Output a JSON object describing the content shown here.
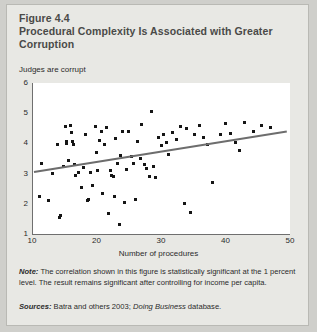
{
  "figure": {
    "number": "Figure 4.4",
    "title": "Procedural Complexity Is Associated with Greater Corruption",
    "note_lead": "Note:",
    "note_text": " The correlation shown in this figure is statistically significant at the 1 percent level. The result remains significant after controlling for income per capita.",
    "sources_lead": "Sources:",
    "sources_text_1": " Batra and others 2003; ",
    "sources_italic": "Doing Business",
    "sources_text_2": " database."
  },
  "colors": {
    "card_background": "#e8e8e4",
    "page_background": "#cfcfcb",
    "plot_background": "#ffffff",
    "axis": "#6f6f6f",
    "point": "#151515",
    "trendline": "#6d6d6d",
    "title_text": "#4a4a48",
    "body_text": "#2b2b2b"
  },
  "chart_data": {
    "type": "scatter",
    "title": "Procedural Complexity Is Associated with Greater Corruption",
    "xlabel": "Number of procedures",
    "ylabel": "Judges are corrupt",
    "xlim": [
      10,
      50
    ],
    "ylim": [
      1,
      6
    ],
    "xticks": [
      10,
      20,
      30,
      40,
      50
    ],
    "yticks": [
      1,
      2,
      3,
      4,
      5,
      6
    ],
    "grid": false,
    "legend": null,
    "trendline": {
      "type": "linear-fit",
      "x_start": 10.3,
      "y_start": 3.08,
      "x_end": 49.5,
      "y_end": 4.42
    },
    "points": [
      {
        "x": 11.2,
        "y": 2.25
      },
      {
        "x": 11.5,
        "y": 3.35
      },
      {
        "x": 12.6,
        "y": 2.1
      },
      {
        "x": 13.2,
        "y": 3.0
      },
      {
        "x": 14.0,
        "y": 3.95
      },
      {
        "x": 14.3,
        "y": 1.55
      },
      {
        "x": 14.4,
        "y": 1.62
      },
      {
        "x": 14.9,
        "y": 3.25
      },
      {
        "x": 15.2,
        "y": 4.55
      },
      {
        "x": 15.3,
        "y": 4.05
      },
      {
        "x": 15.4,
        "y": 4.0
      },
      {
        "x": 15.6,
        "y": 3.42
      },
      {
        "x": 16.0,
        "y": 4.6
      },
      {
        "x": 16.1,
        "y": 4.35
      },
      {
        "x": 16.3,
        "y": 4.05
      },
      {
        "x": 16.4,
        "y": 3.98
      },
      {
        "x": 16.6,
        "y": 3.3
      },
      {
        "x": 16.8,
        "y": 2.95
      },
      {
        "x": 17.2,
        "y": 3.02
      },
      {
        "x": 17.6,
        "y": 2.55
      },
      {
        "x": 18.0,
        "y": 3.2
      },
      {
        "x": 18.3,
        "y": 4.3
      },
      {
        "x": 18.6,
        "y": 2.1
      },
      {
        "x": 18.7,
        "y": 2.15
      },
      {
        "x": 19.0,
        "y": 3.05
      },
      {
        "x": 19.4,
        "y": 2.6
      },
      {
        "x": 19.8,
        "y": 4.55
      },
      {
        "x": 20.0,
        "y": 3.7
      },
      {
        "x": 20.2,
        "y": 3.1
      },
      {
        "x": 20.5,
        "y": 4.1
      },
      {
        "x": 20.8,
        "y": 4.4
      },
      {
        "x": 21.0,
        "y": 2.35
      },
      {
        "x": 21.3,
        "y": 3.95
      },
      {
        "x": 21.6,
        "y": 4.52
      },
      {
        "x": 21.9,
        "y": 1.68
      },
      {
        "x": 22.2,
        "y": 3.1
      },
      {
        "x": 22.4,
        "y": 2.95
      },
      {
        "x": 22.6,
        "y": 2.9
      },
      {
        "x": 22.8,
        "y": 2.25
      },
      {
        "x": 23.0,
        "y": 4.15
      },
      {
        "x": 23.2,
        "y": 3.35
      },
      {
        "x": 23.5,
        "y": 1.3
      },
      {
        "x": 23.7,
        "y": 3.6
      },
      {
        "x": 24.0,
        "y": 4.4
      },
      {
        "x": 24.3,
        "y": 2.05
      },
      {
        "x": 24.6,
        "y": 3.12
      },
      {
        "x": 25.0,
        "y": 4.38
      },
      {
        "x": 25.4,
        "y": 3.55
      },
      {
        "x": 25.8,
        "y": 3.35
      },
      {
        "x": 26.0,
        "y": 2.15
      },
      {
        "x": 26.4,
        "y": 4.05
      },
      {
        "x": 26.8,
        "y": 3.5
      },
      {
        "x": 27.0,
        "y": 4.62
      },
      {
        "x": 27.4,
        "y": 3.3
      },
      {
        "x": 27.8,
        "y": 3.18
      },
      {
        "x": 28.2,
        "y": 2.9
      },
      {
        "x": 28.5,
        "y": 5.05
      },
      {
        "x": 28.8,
        "y": 3.25
      },
      {
        "x": 29.2,
        "y": 2.88
      },
      {
        "x": 29.6,
        "y": 4.18
      },
      {
        "x": 30.0,
        "y": 3.92
      },
      {
        "x": 30.4,
        "y": 4.3
      },
      {
        "x": 30.8,
        "y": 4.02
      },
      {
        "x": 31.2,
        "y": 3.62
      },
      {
        "x": 31.8,
        "y": 4.35
      },
      {
        "x": 32.4,
        "y": 4.12
      },
      {
        "x": 33.0,
        "y": 4.55
      },
      {
        "x": 33.6,
        "y": 2.02
      },
      {
        "x": 34.0,
        "y": 4.48
      },
      {
        "x": 34.6,
        "y": 1.72
      },
      {
        "x": 35.2,
        "y": 4.3
      },
      {
        "x": 36.0,
        "y": 4.58
      },
      {
        "x": 36.6,
        "y": 4.2
      },
      {
        "x": 37.2,
        "y": 3.95
      },
      {
        "x": 38.0,
        "y": 2.7
      },
      {
        "x": 39.2,
        "y": 4.28
      },
      {
        "x": 40.0,
        "y": 4.65
      },
      {
        "x": 40.8,
        "y": 4.32
      },
      {
        "x": 41.5,
        "y": 4.02
      },
      {
        "x": 42.2,
        "y": 3.78
      },
      {
        "x": 43.0,
        "y": 4.7
      },
      {
        "x": 44.4,
        "y": 4.4
      },
      {
        "x": 45.6,
        "y": 4.58
      },
      {
        "x": 47.0,
        "y": 4.52
      }
    ]
  }
}
